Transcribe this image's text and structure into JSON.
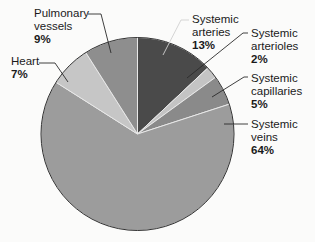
{
  "chart_data": {
    "type": "pie",
    "title": "",
    "start_angle_deg": 0,
    "direction": "clockwise",
    "slices": [
      {
        "label": "Systemic arteries",
        "line1": "Systemic",
        "line2": "arteries",
        "value": 13,
        "pct": "13%",
        "color": "#4a4a4a"
      },
      {
        "label": "Systemic arterioles",
        "line1": "Systemic",
        "line2": "arterioles",
        "value": 2,
        "pct": "2%",
        "color": "#c4c4c4"
      },
      {
        "label": "Systemic capillaries",
        "line1": "Systemic",
        "line2": "capillaries",
        "value": 5,
        "pct": "5%",
        "color": "#8a8a8a"
      },
      {
        "label": "Systemic veins",
        "line1": "Systemic",
        "line2": "veins",
        "value": 64,
        "pct": "64%",
        "color": "#9c9c9c"
      },
      {
        "label": "Heart",
        "line1": "Heart",
        "line2": "",
        "value": 7,
        "pct": "7%",
        "color": "#c6c6c6"
      },
      {
        "label": "Pulmonary vessels",
        "line1": "Pulmonary",
        "line2": "vessels",
        "value": 9,
        "pct": "9%",
        "color": "#8e8e8e"
      }
    ],
    "legend": "none (callout labels)"
  }
}
